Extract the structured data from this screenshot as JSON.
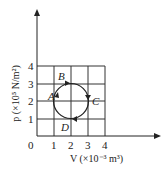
{
  "diagram": {
    "title": "",
    "x_axis": {
      "label": "V (×10⁻³ m³)",
      "ticks": [
        "0",
        "1",
        "2",
        "3",
        "4"
      ]
    },
    "y_axis": {
      "label": "p (×10⁵ N/m²)",
      "ticks": [
        "1",
        "2",
        "3",
        "4"
      ]
    },
    "points": [
      {
        "name": "A",
        "label": "A",
        "V": 1,
        "p": 1.8
      },
      {
        "name": "B",
        "label": "B",
        "V": 1.8,
        "p": 3
      },
      {
        "name": "C",
        "label": "C",
        "V": 3,
        "p": 2.2
      },
      {
        "name": "D",
        "label": "D",
        "V": 2.2,
        "p": 1
      }
    ],
    "cycle": {
      "shape": "circle",
      "center": {
        "V": 2,
        "p": 2
      },
      "radius": 1,
      "direction": "clockwise"
    },
    "colors": {
      "line": "#222222",
      "grid": "#333333"
    }
  }
}
